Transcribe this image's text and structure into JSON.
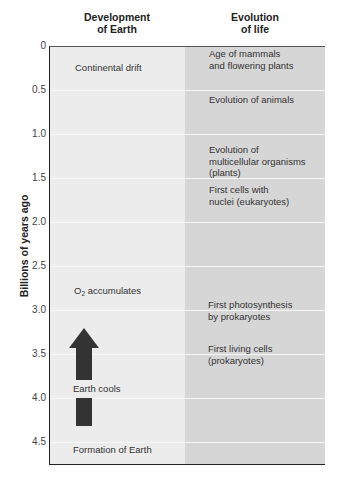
{
  "headers": {
    "left": [
      "Development",
      "of Earth"
    ],
    "right": [
      "Evolution",
      "of life"
    ]
  },
  "axis": {
    "title": "Billions of years ago",
    "ticks": [
      "0",
      "0.5",
      "1.0",
      "1.5",
      "2.0",
      "2.5",
      "3.0",
      "3.5",
      "4.0",
      "4.5"
    ]
  },
  "earth_events": {
    "continental_drift": "Continental drift",
    "o2_prefix": "O",
    "o2_sub": "2",
    "o2_suffix": " accumulates",
    "earth_cools": "Earth cools",
    "formation": "Formation of Earth"
  },
  "life_events": [
    {
      "lines": [
        "Age of mammals",
        "and flowering plants"
      ]
    },
    {
      "lines": [
        "Evolution of animals"
      ]
    },
    {
      "lines": [
        "Evolution of",
        "multicellular organisms",
        "(plants)"
      ]
    },
    {
      "lines": [
        "First cells with",
        "nuclei (eukaryotes)"
      ]
    },
    {
      "lines": [
        "First photosynthesis",
        "by prokaryotes"
      ]
    },
    {
      "lines": [
        "First living cells",
        "(prokaryotes)"
      ]
    }
  ],
  "colors": {
    "left_column": "#ececec",
    "right_column": "#d6d6d6",
    "arrow": "#333333"
  }
}
